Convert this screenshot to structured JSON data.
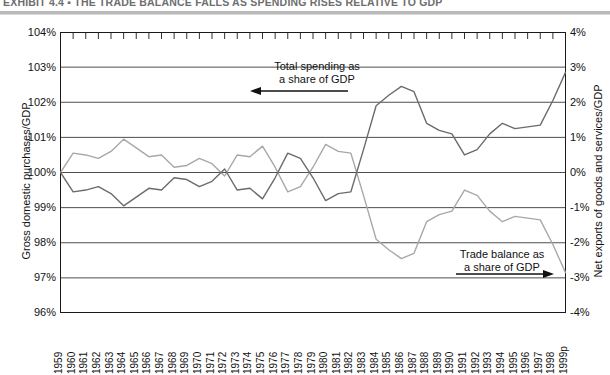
{
  "exhibit": {
    "label": "EXHIBIT 4.4",
    "separator": "▪",
    "title": "THE TRADE BALANCE FALLS AS SPENDING RISES RELATIVE TO GDP",
    "full_title": "EXHIBIT 4.4 ▪ THE TRADE BALANCE FALLS AS SPENDING RISES RELATIVE TO GDP"
  },
  "axes": {
    "left_title": "Gross domestic purchases/GDP",
    "right_title": "Net exports of goods and services/GDP",
    "left_ticks": [
      "104%",
      "103%",
      "102%",
      "101%",
      "100%",
      "99%",
      "98%",
      "97%",
      "96%"
    ],
    "right_ticks": [
      "4%",
      "3%",
      "2%",
      "1%",
      "0%",
      "-1%",
      "-2%",
      "-3%",
      "-4%"
    ]
  },
  "callouts": {
    "spending_line1": "Total spending as",
    "spending_line2": "a share of GDP",
    "trade_line1": "Trade balance as",
    "trade_line2": "a share of GDP"
  },
  "colors": {
    "spending_line": "#6b6b6b",
    "trade_line": "#a8a8a8",
    "gridline": "#3a3a3a",
    "frame": "#1a1a1a",
    "title_band": "#b9b9b9"
  },
  "chart_data": {
    "type": "line",
    "title": "THE TRADE BALANCE FALLS AS SPENDING RISES RELATIVE TO GDP",
    "xlabel": "",
    "ylabel": "Gross domestic purchases/GDP",
    "ylabel_right": "Net exports of goods and services/GDP",
    "ylim": [
      96,
      104
    ],
    "ylim_right": [
      -4,
      4
    ],
    "grid": true,
    "legend_position": "annotations",
    "x": [
      "1959",
      "1960",
      "1961",
      "1962",
      "1963",
      "1964",
      "1965",
      "1966",
      "1967",
      "1968",
      "1969",
      "1970",
      "1971",
      "1972",
      "1973",
      "1974",
      "1975",
      "1976",
      "1977",
      "1978",
      "1979",
      "1980",
      "1981",
      "1982",
      "1983",
      "1984",
      "1985",
      "1986",
      "1987",
      "1988",
      "1989",
      "1990",
      "1991",
      "1992",
      "1993",
      "1994",
      "1995",
      "1996",
      "1997",
      "1998",
      "1999p"
    ],
    "series": [
      {
        "name": "Total spending as a share of GDP",
        "axis": "left",
        "units": "percent of GDP",
        "values": [
          100.0,
          99.45,
          99.5,
          99.6,
          99.4,
          99.05,
          99.3,
          99.55,
          99.5,
          99.85,
          99.8,
          99.6,
          99.75,
          100.1,
          99.5,
          99.55,
          99.25,
          99.85,
          100.55,
          100.4,
          99.85,
          99.2,
          99.4,
          99.45,
          100.65,
          101.9,
          102.2,
          102.45,
          102.3,
          101.4,
          101.2,
          101.1,
          100.5,
          100.65,
          101.1,
          101.4,
          101.25,
          101.3,
          101.35,
          102.05,
          102.85
        ]
      },
      {
        "name": "Trade balance as a share of GDP",
        "axis": "right",
        "units": "percent of GDP",
        "values": [
          0.0,
          0.55,
          0.5,
          0.4,
          0.6,
          0.95,
          0.7,
          0.45,
          0.5,
          0.15,
          0.2,
          0.4,
          0.25,
          -0.1,
          0.5,
          0.45,
          0.75,
          0.15,
          -0.55,
          -0.4,
          0.15,
          0.8,
          0.6,
          0.55,
          -0.65,
          -1.9,
          -2.2,
          -2.45,
          -2.3,
          -1.4,
          -1.2,
          -1.1,
          -0.5,
          -0.65,
          -1.1,
          -1.4,
          -1.25,
          -1.3,
          -1.35,
          -2.05,
          -2.85
        ]
      }
    ]
  }
}
